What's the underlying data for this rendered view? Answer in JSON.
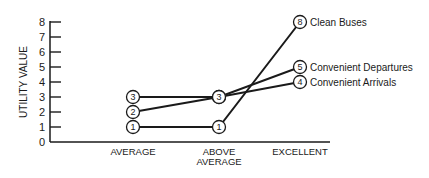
{
  "chart_data": {
    "type": "line",
    "title": "",
    "xlabel": "",
    "ylabel": "UTILITY VALUE",
    "ylim": [
      0,
      8
    ],
    "yticks": [
      0,
      1,
      2,
      3,
      4,
      5,
      6,
      7,
      8
    ],
    "categories": [
      "AVERAGE",
      "ABOVE AVERAGE",
      "EXCELLENT"
    ],
    "grid": false,
    "legend_position": "right (inline labels at line ends)",
    "series": [
      {
        "name": "Clean Buses",
        "values": [
          1,
          1,
          8
        ]
      },
      {
        "name": "Convenient Departures",
        "values": [
          2,
          3,
          5
        ]
      },
      {
        "name": "Convenient Arrivals",
        "values": [
          3,
          3,
          4
        ]
      }
    ]
  },
  "axis": {
    "ylabel": "UTILITY VALUE",
    "yticks": [
      "0",
      "1",
      "2",
      "3",
      "4",
      "5",
      "6",
      "7",
      "8"
    ],
    "xcats": [
      {
        "line1": "AVERAGE",
        "line2": ""
      },
      {
        "line1": "ABOVE",
        "line2": "AVERAGE"
      },
      {
        "line1": "EXCELLENT",
        "line2": ""
      }
    ]
  },
  "legend": [
    "Clean Buses",
    "Convenient Departures",
    "Convenient Arrivals"
  ],
  "colors": {
    "ink": "#1a1a1a",
    "background": "#ffffff"
  }
}
